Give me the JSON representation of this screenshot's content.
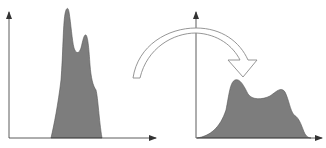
{
  "diagram": {
    "colors": {
      "background": "#ffffff",
      "fill": "#7d7d7d",
      "axis": "#333333",
      "arrow_outline": "#8a8a8a"
    },
    "left_plot": {
      "name": "original-histogram",
      "shape": "narrow bimodal peak"
    },
    "right_plot": {
      "name": "transformed-histogram",
      "shape": "broad bimodal spread"
    },
    "transform_arrow": {
      "direction": "left-to-right",
      "style": "hollow curved arrow"
    }
  }
}
